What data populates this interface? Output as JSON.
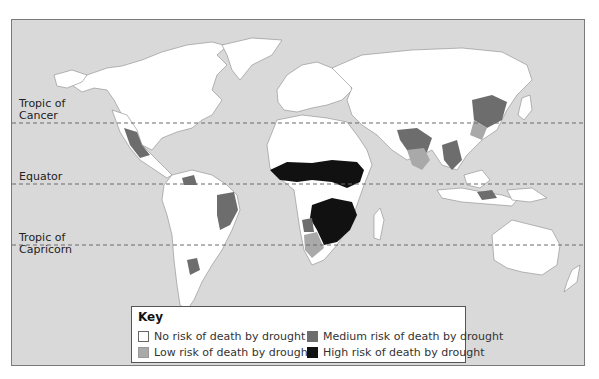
{
  "map": {
    "colors": {
      "ocean": "#d9d9d9",
      "land": "#ffffff",
      "border": "#8a8a8a",
      "no_risk": "#ffffff",
      "low_risk": "#a9a9a9",
      "medium_risk": "#6d6d6d",
      "high_risk": "#111111",
      "latitude_line": "#6a6a6a"
    },
    "latitude_lines": [
      {
        "label_line1": "Tropic of",
        "label_line2": "Cancer"
      },
      {
        "label_line1": "Equator",
        "label_line2": ""
      },
      {
        "label_line1": "Tropic of",
        "label_line2": "Capricorn"
      }
    ]
  },
  "key": {
    "title": "Key",
    "items": [
      {
        "label": "No risk of death by drought",
        "level": "no_risk"
      },
      {
        "label": "Low risk of death by drought",
        "level": "low_risk"
      },
      {
        "label": "Medium risk of death by drought",
        "level": "medium_risk"
      },
      {
        "label": "High risk of death by drought",
        "level": "high_risk"
      }
    ]
  }
}
